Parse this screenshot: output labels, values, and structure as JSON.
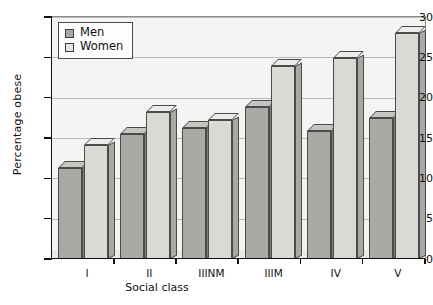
{
  "chart_data": {
    "type": "bar",
    "title": "",
    "xlabel": "Social class",
    "ylabel": "Percentage obese",
    "categories": [
      "I",
      "II",
      "IIINM",
      "IIIM",
      "IV",
      "V"
    ],
    "series": [
      {
        "name": "Men",
        "values": [
          11.3,
          15.5,
          16.2,
          18.8,
          15.9,
          17.5
        ]
      },
      {
        "name": "Women",
        "values": [
          14.1,
          18.2,
          17.2,
          23.9,
          24.9,
          28.0
        ]
      }
    ],
    "ylim": [
      0,
      30
    ],
    "yticks": [
      0,
      5,
      10,
      15,
      20,
      25,
      30
    ],
    "ytick_labels": [
      "0",
      "5",
      "10",
      "15",
      "20",
      "25",
      "30"
    ],
    "grid": true,
    "legend_position": "top-left",
    "style": "3d-bar",
    "colors": {
      "men_face": "#a9a9a6",
      "men_side": "#7e7e7b",
      "men_top": "#c5c5c1",
      "women_face": "#d9d9d5",
      "women_side": "#a8a8a4",
      "women_top": "#ececea",
      "axis": "#111111",
      "gridline": "#b9b9b9",
      "plot_background": "#f4f4f2"
    }
  },
  "legend": {
    "items": [
      {
        "label": "Men"
      },
      {
        "label": "Women"
      }
    ]
  }
}
